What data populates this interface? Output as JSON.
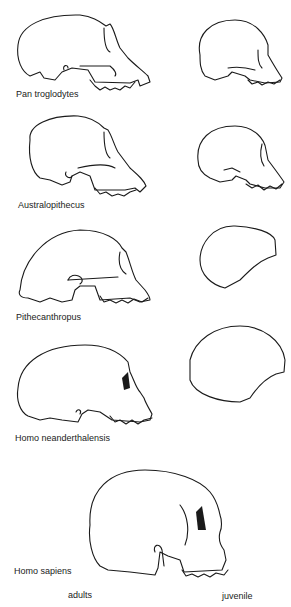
{
  "figure": {
    "rows": [
      {
        "label": "Pan troglodytes",
        "adult": "skull-adult",
        "juvenile": "skull-juvenile"
      },
      {
        "label": "Australopithecus",
        "adult": "skull-adult",
        "juvenile": "skull-juvenile"
      },
      {
        "label": "Pithecanthropus",
        "adult": "skull-adult",
        "juvenile": "braincase-outline"
      },
      {
        "label": "Homo neanderthalensis",
        "adult": "skull-adult",
        "juvenile": "braincase-outline"
      },
      {
        "label": "Homo sapiens",
        "adult": "skull-adult",
        "juvenile": null
      }
    ],
    "columns": {
      "left": "adults",
      "right": "juvenile"
    }
  }
}
